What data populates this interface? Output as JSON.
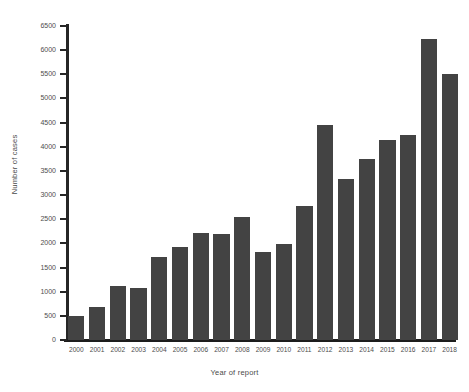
{
  "chart_data": {
    "type": "bar",
    "title": "",
    "xlabel": "Year of report",
    "ylabel": "Number of cases",
    "categories": [
      "2000",
      "2001",
      "2002",
      "2003",
      "2004",
      "2005",
      "2006",
      "2007",
      "2008",
      "2009",
      "2010",
      "2011",
      "2012",
      "2013",
      "2014",
      "2015",
      "2016",
      "2017",
      "2018"
    ],
    "values": [
      500,
      690,
      1110,
      1080,
      1720,
      1930,
      2220,
      2200,
      2550,
      1830,
      1980,
      2780,
      4450,
      3330,
      3740,
      4150,
      4250,
      6230,
      5500
    ],
    "ylim": [
      0,
      6500
    ],
    "yticks": [
      0,
      500,
      1000,
      1500,
      2000,
      2500,
      3000,
      3500,
      4000,
      4500,
      5000,
      5500,
      6000,
      6500
    ],
    "ytick_labels": [
      "0",
      "500",
      "1000",
      "1500",
      "2000",
      "2500",
      "3000",
      "3500",
      "4000",
      "4500",
      "5000",
      "5500",
      "6000",
      "6500"
    ],
    "grid": false,
    "legend": null,
    "bar_color": "#434343",
    "axis_color": "#262626"
  }
}
